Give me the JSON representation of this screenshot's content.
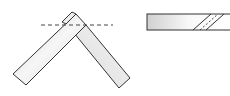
{
  "diagram": {
    "colors": {
      "stroke": "#333333",
      "fill_light": "#f4f4f4",
      "fill_dark": "#cfcfcf",
      "dash": "#444444"
    },
    "left_figure": {
      "label": "",
      "parts": [
        "left-bar",
        "right-bar",
        "cut-line"
      ]
    },
    "right_figure": {
      "label": "",
      "parts": [
        "straight-bar",
        "diagonal-joint"
      ]
    }
  }
}
